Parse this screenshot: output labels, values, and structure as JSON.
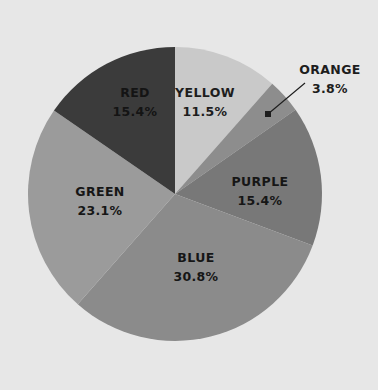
{
  "background_color": "#e7e7e7",
  "chart_data": {
    "type": "pie",
    "title": "",
    "subtitle": "",
    "xlabel": "",
    "ylabel": "",
    "legend": "none",
    "grid": false,
    "label_format": "NAME above PERCENT%",
    "start_angle_deg": 0,
    "direction": "clockwise",
    "total_percent": 100.0,
    "categories": [
      "YELLOW",
      "ORANGE",
      "PURPLE",
      "BLUE",
      "GREEN",
      "RED"
    ],
    "values": [
      11.5,
      3.8,
      15.4,
      30.8,
      23.1,
      15.4
    ],
    "slices": [
      {
        "name": "YELLOW",
        "label": "YELLOW",
        "percent_text": "11.5%",
        "value": 11.5,
        "fill": "#c9c9c9",
        "label_placement": "inside",
        "label_x": 205,
        "label_y": 97,
        "value_x": 205,
        "value_y": 116,
        "label_color": "#1d1d1d"
      },
      {
        "name": "ORANGE",
        "label": "ORANGE",
        "percent_text": "3.8%",
        "value": 3.8,
        "fill": "#8d8d8d",
        "label_placement": "outside",
        "label_x": 330,
        "label_y": 74,
        "value_x": 330,
        "value_y": 93,
        "label_color": "#1d1d1d",
        "leader_from_x": 305,
        "leader_from_y": 83,
        "leader_to_x": 268,
        "leader_to_y": 114
      },
      {
        "name": "PURPLE",
        "label": "PURPLE",
        "percent_text": "15.4%",
        "value": 15.4,
        "fill": "#787878",
        "label_placement": "inside",
        "label_x": 260,
        "label_y": 186,
        "value_x": 260,
        "value_y": 205,
        "label_color": "#161616"
      },
      {
        "name": "BLUE",
        "label": "BLUE",
        "percent_text": "30.8%",
        "value": 30.8,
        "fill": "#8b8b8b",
        "label_placement": "inside",
        "label_x": 196,
        "label_y": 262,
        "value_x": 196,
        "value_y": 281,
        "label_color": "#161616"
      },
      {
        "name": "GREEN",
        "label": "GREEN",
        "percent_text": "23.1%",
        "value": 23.1,
        "fill": "#9b9b9b",
        "label_placement": "inside",
        "label_x": 100,
        "label_y": 196,
        "value_x": 100,
        "value_y": 215,
        "label_color": "#161616"
      },
      {
        "name": "RED",
        "label": "RED",
        "percent_text": "15.4%",
        "value": 15.4,
        "fill": "#3b3b3b",
        "label_placement": "inside",
        "label_x": 135,
        "label_y": 97,
        "value_x": 135,
        "value_y": 116,
        "label_color": "#141414"
      }
    ],
    "geometry": {
      "center_x": 175,
      "center_y": 194,
      "radius": 147
    }
  }
}
